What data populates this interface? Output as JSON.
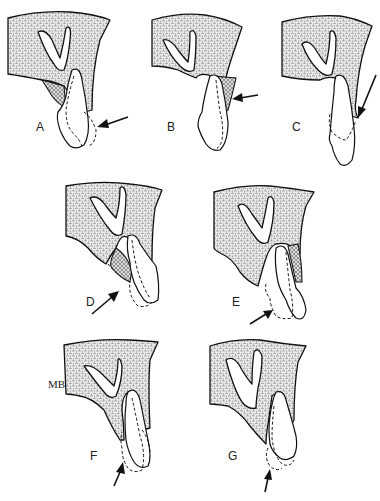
{
  "figure": {
    "panels": [
      {
        "id": "A",
        "label": "A"
      },
      {
        "id": "B",
        "label": "B"
      },
      {
        "id": "C",
        "label": "C"
      },
      {
        "id": "D",
        "label": "D"
      },
      {
        "id": "E",
        "label": "E"
      },
      {
        "id": "F",
        "label": "F",
        "extra_label": "MB"
      },
      {
        "id": "G",
        "label": "G"
      }
    ],
    "colors": {
      "ink": "#111111",
      "background": "#ffffff"
    }
  }
}
